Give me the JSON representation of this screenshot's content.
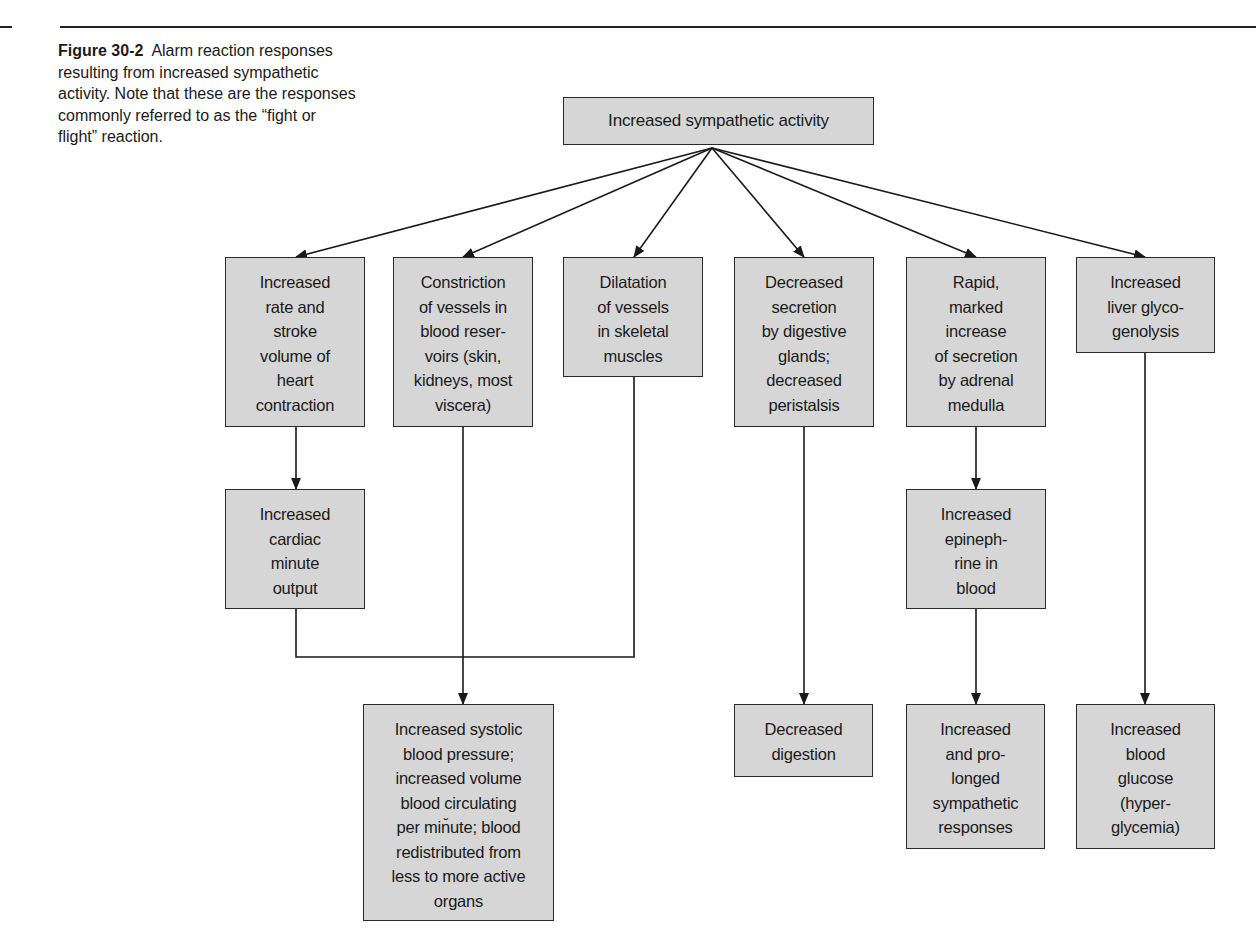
{
  "caption": {
    "figure_label": "Figure 30-2",
    "text": "Alarm reaction responses resulting from increased sympathetic activity. Note that these are the responses commonly referred to as the “fight or flight” reaction."
  },
  "root": {
    "label": "Increased sympathetic activity"
  },
  "effects": [
    {
      "id": "heart",
      "label": "Increased\nrate and\nstroke\nvolume of\nheart\ncontraction"
    },
    {
      "id": "constriction",
      "label": "Constriction\nof vessels in\nblood reser-\nvoirs (skin,\nkidneys, most\nviscera)"
    },
    {
      "id": "dilatation",
      "label": "Dilatation\nof vessels\nin skeletal\nmuscles"
    },
    {
      "id": "digestive",
      "label": "Decreased\nsecretion\nby digestive\nglands;\ndecreased\nperistalsis"
    },
    {
      "id": "adrenal",
      "label": "Rapid,\nmarked\nincrease\nof secretion\nby adrenal\nmedulla"
    },
    {
      "id": "liver",
      "label": "Increased\nliver glyco-\ngenolysis"
    }
  ],
  "intermediate": [
    {
      "id": "cardiac",
      "label": "Increased\ncardiac\nminute\noutput"
    },
    {
      "id": "epinephrine",
      "label": "Increased\nepineph-\nrine in\nblood"
    }
  ],
  "outcomes": [
    {
      "id": "systolic",
      "label": "Increased systolic\nblood pressure;\nincreased volume\nblood circulating\nper min̆ute; blood\nredistributed from\nless to more active\norgans"
    },
    {
      "id": "digestion",
      "label": "Decreased\ndigestion"
    },
    {
      "id": "prolonged",
      "label": "Increased\nand pro-\nlonged\nsympathetic\nresponses"
    },
    {
      "id": "glucose",
      "label": "Increased\nblood\nglucose\n(hyper-\nglycemia)"
    }
  ],
  "style": {
    "box_fill": "#d6d6d6",
    "line_color": "#1a1a1a"
  }
}
